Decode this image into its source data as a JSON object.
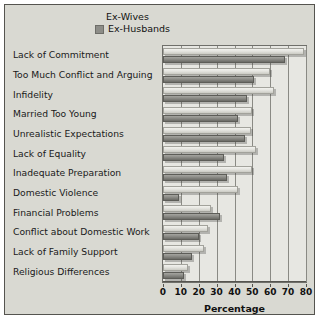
{
  "chart_data": {
    "type": "bar",
    "orientation": "horizontal",
    "title": "",
    "xlabel": "Percentage",
    "ylabel": "",
    "xlim": [
      0,
      80
    ],
    "xticks": [
      0,
      10,
      20,
      30,
      40,
      50,
      60,
      70,
      80
    ],
    "grid": true,
    "legend_position": "top",
    "categories": [
      "Lack of Commitment",
      "Too Much Conflict and Arguing",
      "Infidelity",
      "Married Too Young",
      "Unrealistic Expectations",
      "Lack of Equality",
      "Inadequate Preparation",
      "Domestic Violence",
      "Financial Problems",
      "Conflict about Domestic Work",
      "Lack of Family Support",
      "Religious Differences"
    ],
    "series": [
      {
        "name": "Ex-Wives",
        "color": "#e4e4df",
        "values": [
          79,
          60,
          62,
          50,
          49,
          52,
          50,
          42,
          27,
          25,
          23,
          14
        ]
      },
      {
        "name": "Ex-Husbands",
        "color": "#8c8c87",
        "values": [
          68,
          51,
          47,
          42,
          46,
          34,
          36,
          9,
          32,
          20,
          16,
          12
        ]
      }
    ]
  },
  "legend": {
    "items": [
      {
        "label": "Ex-Wives",
        "swatch": "legend-swatch-wives"
      },
      {
        "label": "Ex-Husbands",
        "swatch": "legend-swatch-husbands"
      }
    ]
  },
  "axis": {
    "title": "Percentage",
    "tick_labels": [
      "0",
      "10",
      "20",
      "30",
      "40",
      "50",
      "60",
      "70",
      "80"
    ]
  }
}
